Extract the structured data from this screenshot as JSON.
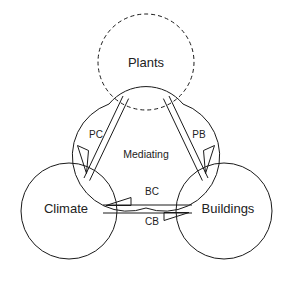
{
  "diagram": {
    "title": "",
    "background_color": "#ffffff",
    "stroke_color": "#1a1a1a",
    "text_color": "#222222",
    "center_region": {
      "label": "Mediating",
      "shape": "rounded-triangle"
    },
    "nodes": [
      {
        "id": "plants",
        "label": "Plants",
        "position": "top",
        "border_style": "dashed",
        "cx": 146,
        "cy": 62,
        "r": 48
      },
      {
        "id": "climate",
        "label": "Climate",
        "position": "bottom-left",
        "border_style": "solid",
        "cx": 69,
        "cy": 211,
        "r": 48
      },
      {
        "id": "buildings",
        "label": "Buildings",
        "position": "bottom-right",
        "border_style": "solid",
        "cx": 224,
        "cy": 211,
        "r": 48
      }
    ],
    "edges": [
      {
        "id": "pc",
        "label": "PC",
        "from": "plants",
        "to": "climate",
        "style": "double-line",
        "arrow": "open-triangle",
        "label_x": 96,
        "label_y": 135
      },
      {
        "id": "pb",
        "label": "PB",
        "from": "plants",
        "to": "buildings",
        "style": "double-line",
        "arrow": "open-triangle",
        "label_x": 199,
        "label_y": 135
      },
      {
        "id": "bc",
        "label": "BC",
        "from": "buildings",
        "to": "climate",
        "style": "single-line",
        "arrow": "open-triangle",
        "label_x": 152,
        "label_y": 192
      },
      {
        "id": "cb",
        "label": "CB",
        "from": "climate",
        "to": "buildings",
        "style": "single-line",
        "arrow": "open-triangle",
        "label_x": 152,
        "label_y": 222
      }
    ]
  }
}
